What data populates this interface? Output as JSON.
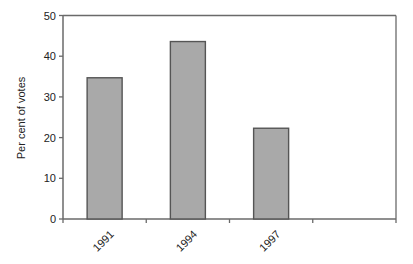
{
  "chart_data": {
    "type": "bar",
    "title": "",
    "xlabel": "",
    "ylabel": "Per cent of votes",
    "categories": [
      "1991",
      "1994",
      "1997",
      ""
    ],
    "values": [
      34.7,
      43.6,
      22.3,
      null
    ],
    "ylim": [
      0,
      50
    ],
    "yticks": [
      0,
      10,
      20,
      30,
      40,
      50
    ],
    "grid": false,
    "legend": null,
    "x_tick_label_rotation": -45,
    "colors": {
      "bar_fill": "#a9a9a9",
      "bar_border": "#555555",
      "axis": "#6a6a6a"
    }
  }
}
